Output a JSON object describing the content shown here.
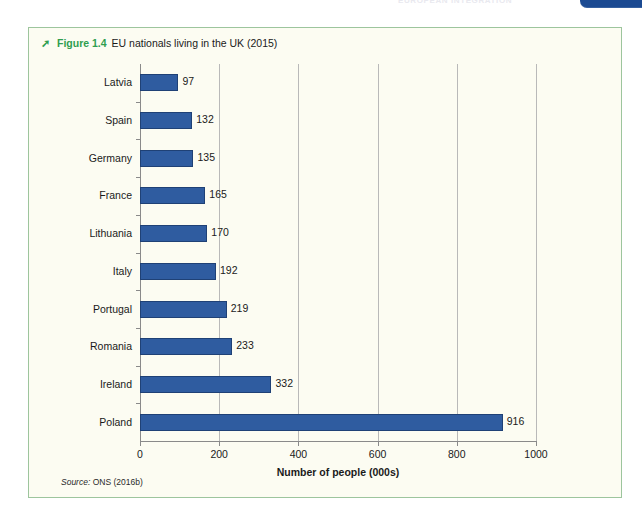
{
  "page": {
    "running_head": "EUROPEAN INTEGRATION",
    "chapter_tab_number": "1"
  },
  "figure": {
    "arrow_icon": "arrow-right-icon",
    "number": "Figure 1.4",
    "title": "EU nationals living in the UK (2015)",
    "source_label": "Source:",
    "source_text": "ONS (2016b)"
  },
  "chart_data": {
    "type": "bar",
    "orientation": "horizontal",
    "title": "EU nationals living in the UK (2015)",
    "categories": [
      "Latvia",
      "Spain",
      "Germany",
      "France",
      "Lithuania",
      "Italy",
      "Portugal",
      "Romania",
      "Ireland",
      "Poland"
    ],
    "values": [
      97,
      132,
      135,
      165,
      170,
      192,
      219,
      233,
      332,
      916
    ],
    "xlabel": "Number of people (000s)",
    "ylabel": "",
    "xlim": [
      0,
      1000
    ],
    "xticks": [
      0,
      200,
      400,
      600,
      800,
      1000
    ],
    "xtick_labels": [
      "0",
      "200",
      "400",
      "600",
      "800",
      "1000"
    ],
    "grid": "vertical",
    "legend": "none",
    "bar_color": "#2f5ca0",
    "bar_edge_color": "#1f4176",
    "data_labels_shown": true
  },
  "colors": {
    "accent_green": "#2f9e4f",
    "figure_border": "#9dc59d",
    "figure_background": "#fcfcf2",
    "bar_blue": "#2f5ca0",
    "tab_blue": "#1b4a92"
  }
}
